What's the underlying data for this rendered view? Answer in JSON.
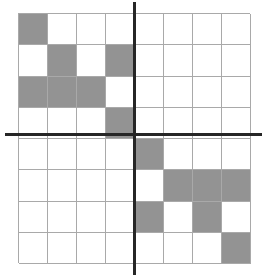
{
  "figure": {
    "type": "grid-diagram",
    "title": "",
    "width": 265,
    "height": 277
  },
  "grid": {
    "rows": 8,
    "columns": 8,
    "origin_x": 18,
    "origin_y": 13,
    "cell_width": 29,
    "cell_height": 31.25,
    "line_color": "#a9a9a9",
    "fill_color": "#939393",
    "background_color": "#ffffff",
    "filled_cells": [
      [
        1,
        1
      ],
      [
        2,
        2
      ],
      [
        2,
        4
      ],
      [
        3,
        1
      ],
      [
        3,
        2
      ],
      [
        3,
        3
      ],
      [
        4,
        4
      ],
      [
        5,
        5
      ],
      [
        6,
        6
      ],
      [
        6,
        7
      ],
      [
        6,
        8
      ],
      [
        7,
        5
      ],
      [
        7,
        7
      ],
      [
        8,
        8
      ]
    ],
    "filled_count": 14
  },
  "axes": {
    "color": "#262626",
    "thickness": 3,
    "horizontal": {
      "label": "x-axis",
      "y": 134,
      "x_start": 5,
      "x_end": 262
    },
    "vertical": {
      "label": "y-axis",
      "x": 134,
      "y_start": 2,
      "y_end": 275
    },
    "origin": {
      "x": 134,
      "y": 134
    }
  },
  "chart_data": {
    "type": "heatmap",
    "title": "",
    "xlabel": "",
    "ylabel": "",
    "columns": [
      "1",
      "2",
      "3",
      "4",
      "5",
      "6",
      "7",
      "8"
    ],
    "rows": [
      "1",
      "2",
      "3",
      "4",
      "5",
      "6",
      "7",
      "8"
    ],
    "matrix": [
      [
        1,
        0,
        0,
        0,
        0,
        0,
        0,
        0
      ],
      [
        0,
        1,
        0,
        1,
        0,
        0,
        0,
        0
      ],
      [
        1,
        1,
        1,
        0,
        0,
        0,
        0,
        0
      ],
      [
        0,
        0,
        0,
        1,
        0,
        0,
        0,
        0
      ],
      [
        0,
        0,
        0,
        0,
        1,
        0,
        0,
        0
      ],
      [
        0,
        0,
        0,
        0,
        0,
        1,
        1,
        1
      ],
      [
        0,
        0,
        0,
        0,
        1,
        0,
        1,
        0
      ],
      [
        0,
        0,
        0,
        0,
        0,
        0,
        0,
        1
      ]
    ],
    "legend": [],
    "grid": true
  }
}
